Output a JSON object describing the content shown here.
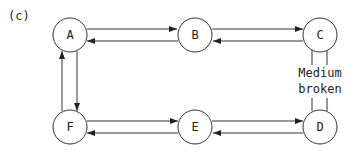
{
  "figure_label": "(c)",
  "nodes": {
    "A": {
      "label": "A"
    },
    "B": {
      "label": "B"
    },
    "C": {
      "label": "C"
    },
    "D": {
      "label": "D"
    },
    "E": {
      "label": "E"
    },
    "F": {
      "label": "F"
    }
  },
  "link_note": {
    "line1": "Medium",
    "line2": "broken"
  },
  "colors": {
    "stroke": "#333333",
    "background": "#ffffff"
  }
}
